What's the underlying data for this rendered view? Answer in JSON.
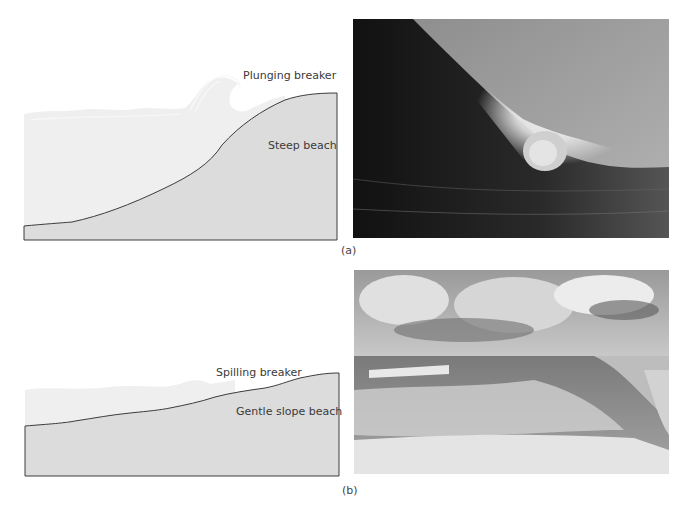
{
  "figure": {
    "panels": [
      {
        "id": "a",
        "caption": "(a)",
        "diagram": {
          "breaker_label": "Plunging breaker",
          "beach_label": "Steep beach"
        },
        "photo": {
          "description": "Large curling plunging wave forming a barrel with spray over dark water"
        }
      },
      {
        "id": "b",
        "caption": "(b)",
        "diagram": {
          "breaker_label": "Spilling breaker",
          "beach_label": "Gentle slope beach"
        },
        "photo": {
          "description": "Cloudy sky over a gently sloping beach with foamy spilling waves"
        }
      }
    ]
  },
  "colors": {
    "background": "#ffffff",
    "water": "#efefef",
    "beach": "#dcdcdc",
    "outline": "#3c3c3c",
    "text": "#3a3a3a"
  }
}
